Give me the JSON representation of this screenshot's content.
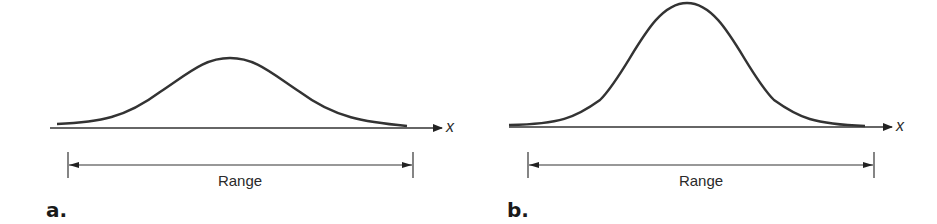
{
  "panels": [
    {
      "id": "a",
      "label": "a.",
      "axis_label": "x",
      "range_label": "Range",
      "description": "Wide, flat normal curve (large spread)"
    },
    {
      "id": "b",
      "label": "b.",
      "axis_label": "x",
      "range_label": "Range",
      "description": "Narrow, tall normal curve (small spread)"
    }
  ],
  "colors": {
    "line": "#333333",
    "background": "#ffffff"
  }
}
